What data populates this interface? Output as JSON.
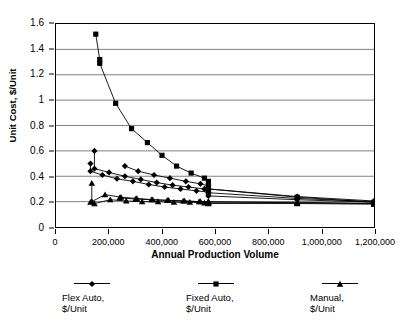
{
  "chart_data": {
    "type": "scatter",
    "title": "",
    "xlabel": "Annual Production Volume",
    "ylabel": "Unit Cost, $/Unit",
    "xlim": [
      0,
      1200000
    ],
    "ylim": [
      0,
      1.6
    ],
    "xticks": [
      0,
      200000,
      400000,
      600000,
      800000,
      1000000,
      1200000
    ],
    "xtick_labels": [
      "0",
      "200,000",
      "400,000",
      "600,000",
      "800,000",
      "1,000,000",
      "1,200,000"
    ],
    "yticks": [
      0,
      0.2,
      0.4,
      0.6,
      0.8,
      1,
      1.2,
      1.4,
      1.6
    ],
    "ytick_labels": [
      "0",
      "0.2",
      "0.4",
      "0.6",
      "0.8",
      "1",
      "1.2",
      "1.4",
      "1.6"
    ],
    "grid": "horizontal",
    "grid_color": "#808080",
    "legend_position": "bottom",
    "line_color": "#000000",
    "marker_color": "#000000",
    "series": [
      {
        "name": "Flex Auto, $/Unit",
        "label_line1": "Flex Auto,",
        "label_line2": "$/Unit",
        "marker": "diamond",
        "branches": [
          {
            "x": [
              130000,
              130000,
              175000,
              230000,
              290000,
              350000,
              410000,
              470000,
              530000,
              575000,
              575000,
              575000,
              910000,
              1200000
            ],
            "y": [
              0.5,
              0.44,
              0.41,
              0.38,
              0.36,
              0.335,
              0.315,
              0.3,
              0.285,
              0.275,
              0.26,
              0.245,
              0.215,
              0.195
            ]
          },
          {
            "x": [
              145000,
              145000,
              200000,
              260000,
              320000,
              380000,
              440000,
              500000,
              560000,
              575000,
              575000,
              910000,
              1200000
            ],
            "y": [
              0.6,
              0.46,
              0.43,
              0.4,
              0.375,
              0.35,
              0.33,
              0.315,
              0.3,
              0.285,
              0.27,
              0.225,
              0.2
            ]
          },
          {
            "x": [
              260000,
              310000,
              370000,
              430000,
              490000,
              545000,
              575000,
              575000,
              910000,
              1200000
            ],
            "y": [
              0.48,
              0.44,
              0.41,
              0.385,
              0.36,
              0.34,
              0.325,
              0.3,
              0.24,
              0.205
            ]
          }
        ]
      },
      {
        "name": "Fixed Auto, $/Unit",
        "label_line1": "Fixed Auto,",
        "label_line2": "$/Unit",
        "marker": "square",
        "branches": [
          {
            "x": [
              150000,
              165000,
              165000,
              225000,
              285000,
              345000,
              400000,
              455000,
              510000,
              560000,
              575000,
              575000,
              575000,
              910000,
              1200000
            ],
            "y": [
              1.52,
              1.32,
              1.29,
              0.975,
              0.775,
              0.665,
              0.565,
              0.48,
              0.425,
              0.385,
              0.36,
              0.325,
              0.3,
              0.235,
              0.195
            ]
          }
        ]
      },
      {
        "name": "Manual, $/Unit",
        "label_line1": "Manual,",
        "label_line2": "$/Unit",
        "marker": "triangle",
        "branches": [
          {
            "x": [
              135000,
              135000,
              185000,
              245000,
              305000,
              365000,
              425000,
              485000,
              545000,
              575000,
              575000,
              910000,
              1200000
            ],
            "y": [
              0.345,
              0.2,
              0.255,
              0.235,
              0.225,
              0.215,
              0.21,
              0.205,
              0.2,
              0.2,
              0.195,
              0.195,
              0.185
            ]
          },
          {
            "x": [
              130000,
              145000,
              205000,
              265000,
              325000,
              385000,
              445000,
              505000,
              560000,
              575000,
              575000,
              910000,
              1200000
            ],
            "y": [
              0.195,
              0.185,
              0.215,
              0.205,
              0.2,
              0.2,
              0.195,
              0.195,
              0.19,
              0.19,
              0.185,
              0.185,
              0.18
            ]
          },
          {
            "x": [
              240000,
              300000,
              360000,
              420000,
              480000,
              540000,
              575000,
              910000,
              1200000
            ],
            "y": [
              0.23,
              0.22,
              0.215,
              0.21,
              0.205,
              0.2,
              0.2,
              0.19,
              0.185
            ]
          }
        ]
      }
    ]
  }
}
